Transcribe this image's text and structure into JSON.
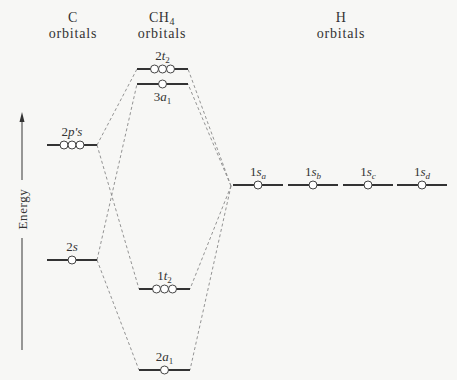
{
  "headers": {
    "c_title": "C",
    "c_sub": "orbitals",
    "ch4_title": "CH",
    "ch4_sub_index": "4",
    "ch4_sub": "orbitals",
    "h_title": "H",
    "h_sub": "orbitals"
  },
  "axis": {
    "label": "Energy"
  },
  "c_orbitals": [
    {
      "id": "2p",
      "label_main": "2",
      "label_italic": "p",
      "label_rest": "'s",
      "degeneracy": 3
    },
    {
      "id": "2s",
      "label_main": "2",
      "label_italic": "s",
      "label_rest": "",
      "degeneracy": 1
    }
  ],
  "ch4_orbitals": [
    {
      "id": "2t2",
      "label_main": "2",
      "label_italic": "t",
      "label_sub": "2",
      "degeneracy": 3
    },
    {
      "id": "3a1",
      "label_main": "3",
      "label_italic": "a",
      "label_sub": "1",
      "degeneracy": 1
    },
    {
      "id": "1t2",
      "label_main": "1",
      "label_italic": "t",
      "label_sub": "2",
      "degeneracy": 3
    },
    {
      "id": "2a1",
      "label_main": "2",
      "label_italic": "a",
      "label_sub": "1",
      "degeneracy": 1
    }
  ],
  "h_orbitals": [
    {
      "id": "1sa",
      "label_main": "1",
      "label_italic": "s",
      "label_sub": "a",
      "degeneracy": 1
    },
    {
      "id": "1sb",
      "label_main": "1",
      "label_italic": "s",
      "label_sub": "b",
      "degeneracy": 1
    },
    {
      "id": "1sc",
      "label_main": "1",
      "label_italic": "s",
      "label_sub": "c",
      "degeneracy": 1
    },
    {
      "id": "1sd",
      "label_main": "1",
      "label_italic": "s",
      "label_sub": "d",
      "degeneracy": 1
    }
  ],
  "correlations": [
    {
      "from": "2p",
      "to": "2t2"
    },
    {
      "from": "2p",
      "to": "1t2"
    },
    {
      "from": "2s",
      "to": "3a1"
    },
    {
      "from": "2s",
      "to": "2a1"
    },
    {
      "from": "H",
      "to": "2t2"
    },
    {
      "from": "H",
      "to": "3a1"
    },
    {
      "from": "H",
      "to": "1t2"
    },
    {
      "from": "H",
      "to": "2a1"
    }
  ]
}
